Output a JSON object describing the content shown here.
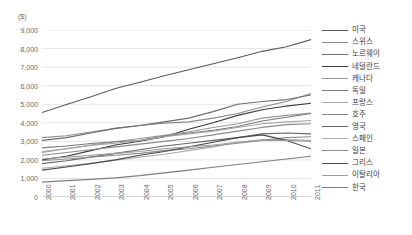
{
  "chart_data": {
    "type": "line",
    "title": "",
    "subtitle": "",
    "xlabel": "",
    "ylabel": "",
    "unit_label": "($)",
    "ylim": [
      0,
      9000
    ],
    "ytick_step": 1000,
    "grid": true,
    "legend_position": "right",
    "x": [
      "2000",
      "2001",
      "2002",
      "2003",
      "2004",
      "2005",
      "2006",
      "2007",
      "2008",
      "2009",
      "2010",
      "2011"
    ],
    "ytick_labels": [
      "9,000",
      "8,000",
      "7,000",
      "6,000",
      "5,000",
      "4,000",
      "3,000",
      "2,000",
      "1,000",
      "0"
    ],
    "ytick_values": [
      9000,
      8000,
      7000,
      6000,
      5000,
      4000,
      3000,
      2000,
      1000,
      0
    ],
    "series": [
      {
        "name": "미국",
        "color": "#5a5a5a",
        "values": [
          4550,
          4980,
          5400,
          5850,
          6180,
          6530,
          6860,
          7180,
          7500,
          7850,
          8100,
          8480
        ]
      },
      {
        "name": "스위스",
        "color": "#8c8c8c",
        "values": [
          3200,
          3300,
          3500,
          3700,
          3850,
          3980,
          4050,
          4250,
          4500,
          4850,
          5150,
          5580
        ]
      },
      {
        "name": "노르웨이",
        "color": "#6e6e6e",
        "values": [
          3050,
          3200,
          3450,
          3700,
          3850,
          4050,
          4250,
          4600,
          5000,
          5150,
          5250,
          5500
        ]
      },
      {
        "name": "네덜란드",
        "color": "#3a3a3a",
        "values": [
          2000,
          2200,
          2500,
          2800,
          3000,
          3250,
          3650,
          4000,
          4400,
          4700,
          4900,
          5050
        ]
      },
      {
        "name": "캐나다",
        "color": "#9a9a9a",
        "values": [
          2400,
          2600,
          2800,
          2980,
          3150,
          3320,
          3520,
          3750,
          3950,
          4250,
          4400,
          4520
        ]
      },
      {
        "name": "독일",
        "color": "#7a7a7a",
        "values": [
          2650,
          2750,
          2880,
          2980,
          3050,
          3280,
          3450,
          3600,
          3800,
          4100,
          4300,
          4500
        ]
      },
      {
        "name": "프랑스",
        "color": "#a5a5a5",
        "values": [
          2450,
          2600,
          2780,
          2900,
          3050,
          3250,
          3400,
          3550,
          3750,
          3950,
          4050,
          4120
        ]
      },
      {
        "name": "호주",
        "color": "#8a8a8a",
        "values": [
          2250,
          2400,
          2550,
          2700,
          2850,
          3000,
          3150,
          3350,
          3550,
          3750,
          3900,
          3950
        ]
      },
      {
        "name": "영국",
        "color": "#666666",
        "values": [
          1800,
          1950,
          2150,
          2350,
          2550,
          2750,
          2900,
          3050,
          3200,
          3400,
          3450,
          3400
        ]
      },
      {
        "name": "스페인",
        "color": "#b0b0b0",
        "values": [
          1550,
          1680,
          1820,
          1980,
          2150,
          2300,
          2500,
          2700,
          2950,
          3100,
          3100,
          3050
        ]
      },
      {
        "name": "일본",
        "color": "#8f8f8f",
        "values": [
          1950,
          2050,
          2150,
          2250,
          2350,
          2500,
          2600,
          2750,
          2900,
          3050,
          3200,
          3250
        ]
      },
      {
        "name": "그리스",
        "color": "#4a4a4a",
        "values": [
          1450,
          1620,
          1800,
          2000,
          2250,
          2450,
          2700,
          2950,
          3200,
          3350,
          3050,
          2600
        ]
      },
      {
        "name": "이탈리아",
        "color": "#9e9e9e",
        "values": [
          2050,
          2150,
          2250,
          2350,
          2450,
          2600,
          2700,
          2800,
          2950,
          3050,
          3050,
          3000
        ]
      },
      {
        "name": "한국",
        "color": "#7e7e7e",
        "values": [
          800,
          880,
          950,
          1030,
          1150,
          1300,
          1450,
          1600,
          1750,
          1900,
          2050,
          2200
        ]
      }
    ]
  }
}
